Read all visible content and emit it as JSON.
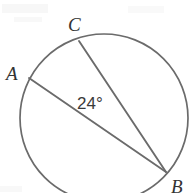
{
  "figure": {
    "background_color": "#ffffff",
    "stroke_color": "#6b6b6b",
    "text_color": "#333333",
    "width": 194,
    "height": 193
  },
  "circle": {
    "center_x": 104,
    "center_y": 118,
    "radius": 84,
    "stroke_width": 1.7
  },
  "points": {
    "A": {
      "label": "A",
      "x": 29,
      "y": 78
    },
    "B": {
      "label": "B",
      "x": 166,
      "y": 172
    },
    "C": {
      "label": "C",
      "x": 79,
      "y": 41
    }
  },
  "chords": [
    {
      "name": "chord-AB",
      "from": "A",
      "to": "B"
    },
    {
      "name": "chord-CB",
      "from": "C",
      "to": "B"
    }
  ],
  "angle": {
    "label": "24°",
    "value": 24,
    "unit": "degrees",
    "vertex": "B",
    "rays": [
      "A",
      "C"
    ]
  },
  "chart_data": {
    "type": "diagram",
    "shapes": [
      {
        "kind": "circle",
        "cx": 104,
        "cy": 118,
        "r": 84
      },
      {
        "kind": "segment",
        "x1": 29,
        "y1": 78,
        "x2": 166,
        "y2": 172,
        "label": "AB"
      },
      {
        "kind": "segment",
        "x1": 79,
        "y1": 41,
        "x2": 166,
        "y2": 172,
        "label": "CB"
      }
    ],
    "annotations": [
      {
        "text": "A",
        "x": 14,
        "y": 75
      },
      {
        "text": "C",
        "x": 76,
        "y": 26
      },
      {
        "text": "B",
        "x": 180,
        "y": 188
      },
      {
        "text": "24°",
        "x": 97,
        "y": 104
      }
    ]
  }
}
